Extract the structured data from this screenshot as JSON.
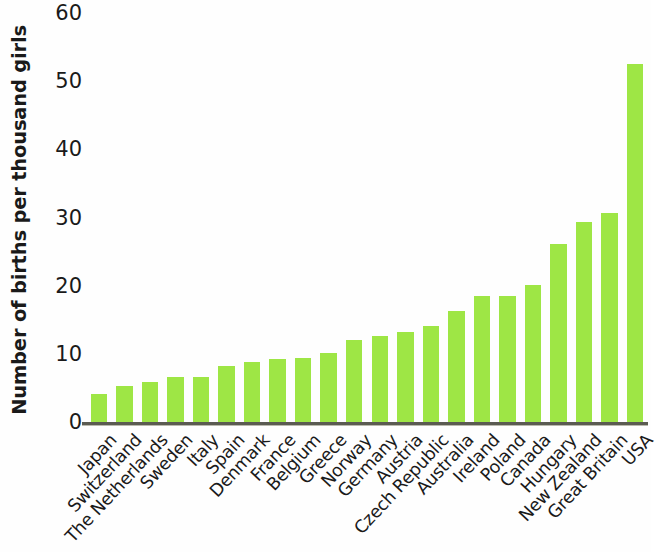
{
  "chart_data": {
    "type": "bar",
    "title": "",
    "xlabel": "",
    "ylabel": "Number of births per thousand girls",
    "ylim": [
      0,
      60
    ],
    "ytick_labels": [
      "0",
      "10",
      "20",
      "30",
      "40",
      "50",
      "60"
    ],
    "yticks": [
      0,
      10,
      20,
      30,
      40,
      50,
      60
    ],
    "grid": false,
    "legend": false,
    "bar_color": "#9ee645",
    "axis_color": "#5b5b52",
    "categories": [
      "Japan",
      "Switzerland",
      "The Netherlands",
      "Sweden",
      "Italy",
      "Spain",
      "Denmark",
      "France",
      "Belgium",
      "Greece",
      "Norway",
      "Germany",
      "Austria",
      "Czech Republic",
      "Australia",
      "Ireland",
      "Poland",
      "Canada",
      "Hungary",
      "New Zealand",
      "Great Britain",
      "USA"
    ],
    "values": [
      4.3,
      5.5,
      6.0,
      6.8,
      6.7,
      8.4,
      8.9,
      9.4,
      9.6,
      10.3,
      12.2,
      12.7,
      13.3,
      14.3,
      16.4,
      18.7,
      18.6,
      20.3,
      26.3,
      29.5,
      30.8,
      52.6
    ]
  }
}
